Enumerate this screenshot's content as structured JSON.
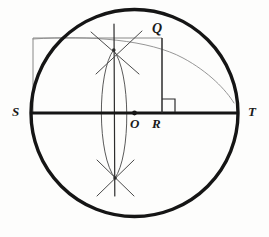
{
  "figure": {
    "kind": "geometry-construction-diagram",
    "width": 269,
    "height": 237,
    "background_color": "#fdfdfc",
    "ink_color": "#1a1a1a",
    "construction_line_color": "#6b6b6b",
    "labels": {
      "S": "S",
      "T": "T",
      "O": "O",
      "R": "R",
      "Q": "Q"
    },
    "points": {
      "O": {
        "x": 134.5,
        "y": 113.0,
        "role": "circle-center"
      },
      "S": {
        "x": 31.0,
        "y": 113.0,
        "role": "diameter-left-endpoint"
      },
      "T": {
        "x": 238.0,
        "y": 113.0,
        "role": "diameter-right-endpoint"
      },
      "Q": {
        "x": 162.0,
        "y": 38.0,
        "role": "point-on-arc"
      },
      "R": {
        "x": 162.0,
        "y": 113.0,
        "role": "foot-of-perpendicular"
      }
    },
    "circle": {
      "cx": 134.5,
      "cy": 113.0,
      "r": 103.5,
      "stroke_width": 3.2
    },
    "diameter_line": {
      "from": "S",
      "to": "T",
      "y": 113.0,
      "stroke_width": 3.0
    },
    "rectangle": {
      "left": 33.0,
      "top": 38.0,
      "right": 162.0,
      "bottom": 113.0,
      "stroke_width": 0.8
    },
    "right_angle_marker": {
      "x": 162.0,
      "y": 99.0,
      "size": 13.0,
      "stroke_width": 1.0
    },
    "vertical_QR": {
      "x": 162.0,
      "from_y": 38.0,
      "to_y": 113.0,
      "stroke_width": 1.1
    },
    "thin_arc_through_Q": {
      "description": "light arc from Q curving down-right toward circle rim",
      "stroke_width": 0.8
    },
    "vesica_arcs": {
      "description": "two compass arcs centred at S and T forming a lens through the centre",
      "top_intersection": {
        "x": 113.5,
        "y": 50.0
      },
      "bottom_intersection": {
        "x": 115.0,
        "y": 178.0
      },
      "stroke_width": 0.9
    },
    "bisector_vertical": {
      "x": 114.0,
      "from_y": 24.0,
      "to_y": 196.0,
      "stroke_width": 1.1
    },
    "cross_ticks_top": {
      "center": {
        "x": 113.5,
        "y": 50.0
      },
      "stroke_width": 1.0
    },
    "cross_ticks_bottom": {
      "center": {
        "x": 115.0,
        "y": 178.0
      },
      "stroke_width": 1.0
    }
  }
}
